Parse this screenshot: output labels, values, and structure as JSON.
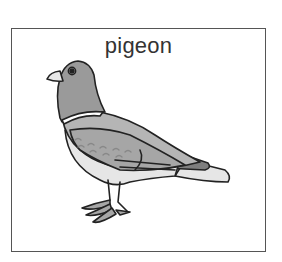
{
  "card": {
    "label": "pigeon",
    "illustration": "pigeon-illustration"
  },
  "colors": {
    "border": "#555555",
    "text": "#333333",
    "head": "#9a9a9a",
    "body": "#b5b5b5",
    "wing": "#a6a6a6",
    "tail_dark": "#7e7e7e",
    "belly": "#e6e6e6",
    "outline": "#222222"
  }
}
